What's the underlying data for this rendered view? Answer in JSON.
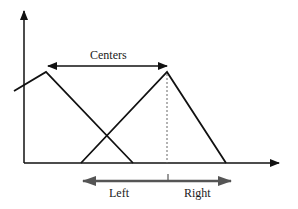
{
  "diagram": {
    "type": "fuzzy-membership-triangles",
    "labels": {
      "centers": "Centers",
      "left": "Left",
      "right": "Right"
    },
    "colors": {
      "line": "#111111",
      "bottom_arrow": "#555555",
      "dashed": "#666666",
      "background": "#ffffff"
    },
    "axes": {
      "y_axis": {
        "x": 24,
        "y_top": 10,
        "y_bottom": 163
      },
      "x_axis": {
        "y": 163,
        "x_left": 24,
        "x_right": 280
      }
    },
    "triangles": [
      {
        "name": "left-triangle",
        "points": [
          [
            14,
            91
          ],
          [
            46,
            72
          ],
          [
            133,
            163
          ]
        ]
      },
      {
        "name": "right-triangle",
        "points": [
          [
            81,
            163
          ],
          [
            167,
            72
          ],
          [
            226,
            163
          ]
        ]
      }
    ],
    "centers_arrow": {
      "y": 66,
      "x_from": 46,
      "x_to": 167
    },
    "center_dashed_line": {
      "x": 167,
      "y_top": 74,
      "y_bottom": 163
    },
    "bottom_arrow": {
      "y": 181,
      "x_from": 83,
      "x_to": 230,
      "tick_x": 168
    }
  }
}
